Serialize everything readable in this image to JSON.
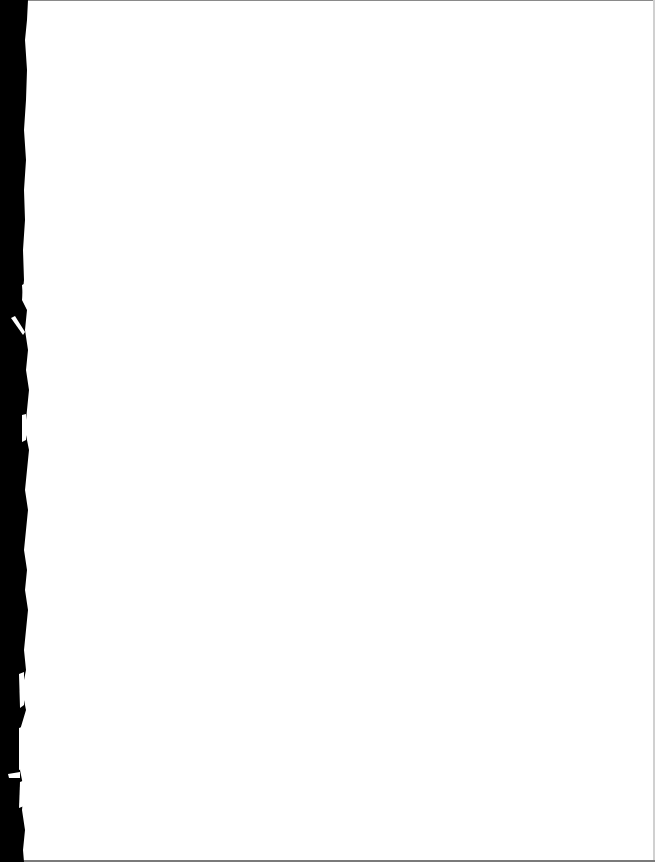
{
  "document": {
    "type": "scanned-page",
    "content": "",
    "background_color": "#ffffff",
    "edge_color": "#000000",
    "border_color": "#8a8a8a"
  }
}
